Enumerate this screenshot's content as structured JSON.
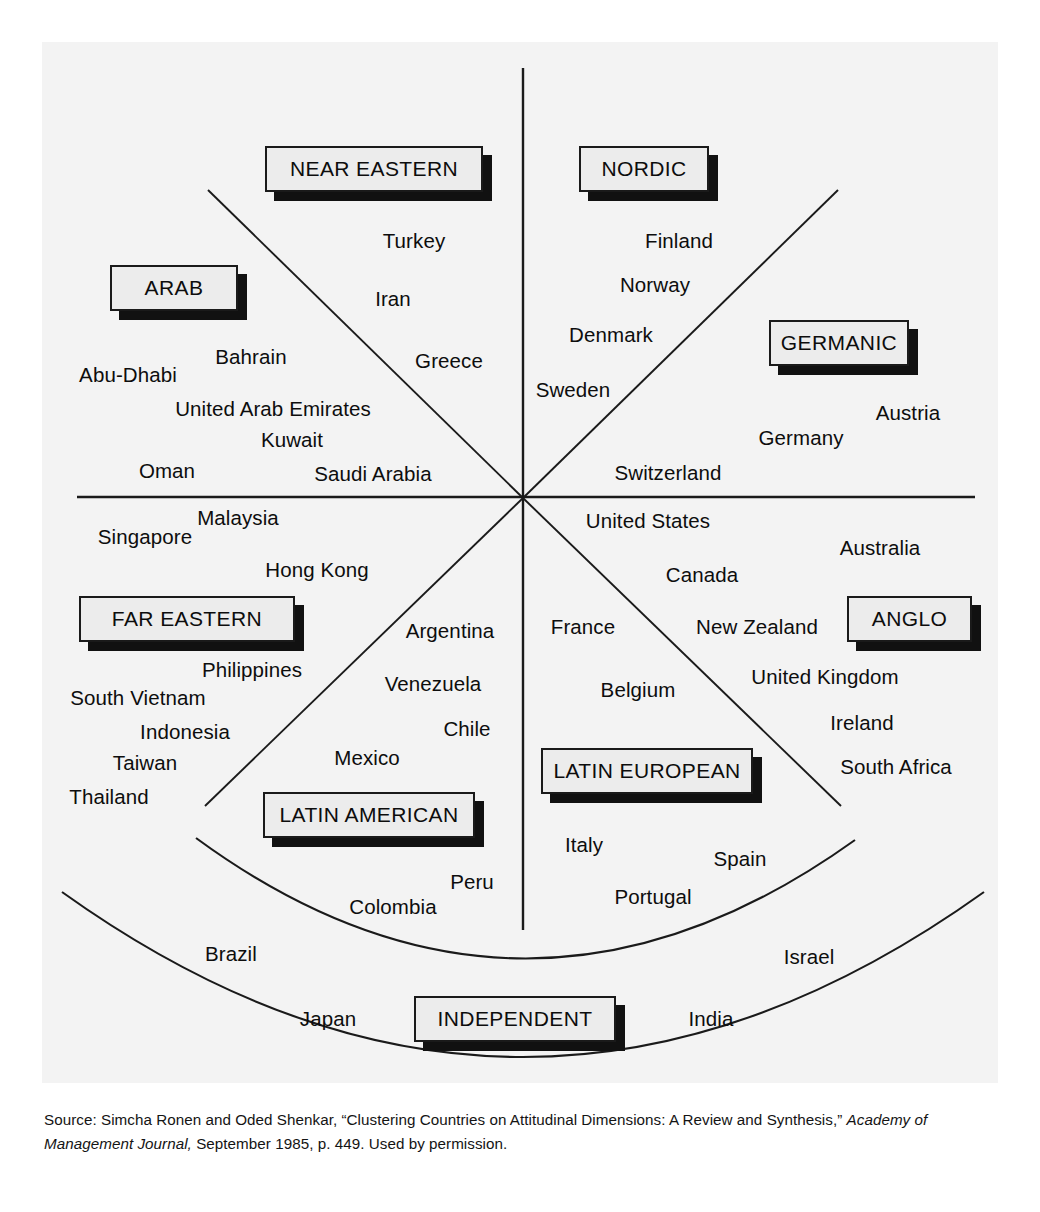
{
  "figure": {
    "background_color": "#f3f3f3",
    "line_color": "#1a1a1a",
    "label_fill_color": "#ececec",
    "label_shadow_color": "#111111"
  },
  "clusters": [
    {
      "id": "near-eastern",
      "label": "NEAR EASTERN",
      "countries": [
        "Turkey",
        "Iran",
        "Greece"
      ]
    },
    {
      "id": "arab",
      "label": "ARAB",
      "countries": [
        "Abu-Dhabi",
        "Bahrain",
        "United Arab Emirates",
        "Kuwait",
        "Oman",
        "Saudi Arabia"
      ]
    },
    {
      "id": "nordic",
      "label": "NORDIC",
      "countries": [
        "Finland",
        "Norway",
        "Denmark",
        "Sweden"
      ]
    },
    {
      "id": "germanic",
      "label": "GERMANIC",
      "countries": [
        "Austria",
        "Germany",
        "Switzerland"
      ]
    },
    {
      "id": "far-eastern",
      "label": "FAR EASTERN",
      "countries": [
        "Singapore",
        "Malaysia",
        "Hong Kong",
        "Philippines",
        "South Vietnam",
        "Indonesia",
        "Taiwan",
        "Thailand"
      ]
    },
    {
      "id": "anglo",
      "label": "ANGLO",
      "countries": [
        "United States",
        "Australia",
        "Canada",
        "New Zealand",
        "United Kingdom",
        "Ireland",
        "South Africa"
      ]
    },
    {
      "id": "latin-american",
      "label": "LATIN AMERICAN",
      "countries": [
        "Argentina",
        "Venezuela",
        "Chile",
        "Mexico",
        "Peru",
        "Colombia"
      ]
    },
    {
      "id": "latin-european",
      "label": "LATIN EUROPEAN",
      "countries": [
        "France",
        "Belgium",
        "Italy",
        "Spain",
        "Portugal"
      ]
    },
    {
      "id": "independent",
      "label": "INDEPENDENT",
      "countries": [
        "Brazil",
        "Japan",
        "Israel",
        "India"
      ]
    }
  ],
  "labels": {
    "near_eastern": "NEAR EASTERN",
    "arab": "ARAB",
    "nordic": "NORDIC",
    "germanic": "GERMANIC",
    "far_eastern": "FAR EASTERN",
    "anglo": "ANGLO",
    "latin_american": "LATIN AMERICAN",
    "latin_european": "LATIN EUROPEAN",
    "independent": "INDEPENDENT"
  },
  "countries": {
    "turkey": "Turkey",
    "iran": "Iran",
    "greece": "Greece",
    "abu_dhabi": "Abu-Dhabi",
    "bahrain": "Bahrain",
    "uae": "United Arab Emirates",
    "kuwait": "Kuwait",
    "oman": "Oman",
    "saudi_arabia": "Saudi Arabia",
    "finland": "Finland",
    "norway": "Norway",
    "denmark": "Denmark",
    "sweden": "Sweden",
    "austria": "Austria",
    "germany": "Germany",
    "switzerland": "Switzerland",
    "singapore": "Singapore",
    "malaysia": "Malaysia",
    "hong_kong": "Hong Kong",
    "philippines": "Philippines",
    "south_vietnam": "South Vietnam",
    "indonesia": "Indonesia",
    "taiwan": "Taiwan",
    "thailand": "Thailand",
    "united_states": "United States",
    "australia": "Australia",
    "canada": "Canada",
    "new_zealand": "New Zealand",
    "united_kingdom": "United Kingdom",
    "ireland": "Ireland",
    "south_africa": "South Africa",
    "argentina": "Argentina",
    "venezuela": "Venezuela",
    "chile": "Chile",
    "mexico": "Mexico",
    "peru": "Peru",
    "colombia": "Colombia",
    "france": "France",
    "belgium": "Belgium",
    "italy": "Italy",
    "spain": "Spain",
    "portugal": "Portugal",
    "brazil": "Brazil",
    "japan": "Japan",
    "israel": "Israel",
    "india": "India"
  },
  "source": {
    "part1": "Source: Simcha Ronen and Oded Shenkar, “Clustering Countries on Attitudinal Dimensions: A Review and Synthesis,” ",
    "italic1": "Academy of Management Journal,",
    "part2": " September 1985, p. 449. Used by permission."
  }
}
